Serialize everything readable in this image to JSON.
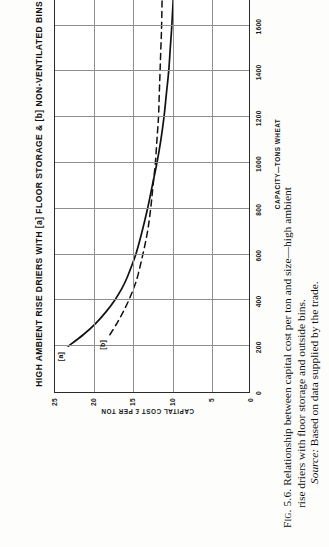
{
  "figure": {
    "chart_title": "HIGH AMBIENT RISE DRIERS WITH [a] FLOOR STORAGE & [b] NON-VENTILATED BINS OUTSIDE",
    "curve_label_a": "[a]",
    "curve_label_b": "[b]"
  },
  "caption": {
    "line1_label": "Fig. 5.6.",
    "line1_text": "Relationship between capital cost per ton and size—high ambient",
    "line2_text": "rise driers with floor storage and outside bins.",
    "line3_source_label": "Source:",
    "line3_text": "Based on data supplied by the trade."
  },
  "chart_data": {
    "type": "line",
    "title": "HIGH AMBIENT RISE DRIERS WITH [a] FLOOR STORAGE & [b] NON-VENTILATED BINS OUTSIDE",
    "xlabel": "CAPACITY—TONS WHEAT",
    "ylabel": "CAPITAL COST  £ PER TON",
    "xlim": [
      0,
      2000
    ],
    "ylim": [
      0,
      25
    ],
    "xticks": [
      0,
      200,
      400,
      600,
      800,
      1000,
      1200,
      1400,
      1600,
      1800,
      2000
    ],
    "xticklabels": [
      "0",
      "200",
      "400",
      "600",
      "800",
      "1000",
      "1200",
      "1400",
      "1600",
      "1800",
      "2000"
    ],
    "yticks": [
      0,
      5,
      10,
      15,
      20,
      25
    ],
    "yticklabels": [
      "0",
      "5",
      "10",
      "15",
      "20",
      "25"
    ],
    "grid": true,
    "grid_x_at": [
      200,
      400,
      600,
      800,
      1000,
      1200,
      1400,
      1600,
      1800
    ],
    "grid_y_at": [
      5,
      10,
      15,
      20
    ],
    "legend": "inline-labels",
    "series": [
      {
        "name": "[a] Floor storage",
        "style": "solid",
        "x": [
          200,
          250,
          300,
          350,
          400,
          450,
          500,
          600,
          700,
          800,
          900,
          1000,
          1100,
          1200,
          1300,
          1400,
          1500,
          1600,
          1800,
          2000
        ],
        "y": [
          23.3,
          21.4,
          19.8,
          18.5,
          17.4,
          16.5,
          15.8,
          14.7,
          13.9,
          13.2,
          12.6,
          12.0,
          11.5,
          11.1,
          10.8,
          10.5,
          10.3,
          10.1,
          9.8,
          9.6
        ]
      },
      {
        "name": "[b] Non-ventilated bins outside",
        "style": "dashed",
        "x": [
          250,
          300,
          350,
          400,
          450,
          500,
          600,
          700,
          800,
          900,
          1000,
          1100,
          1200,
          1300,
          1400,
          1500,
          1600,
          1800,
          2000
        ],
        "y": [
          18.0,
          17.1,
          16.3,
          15.6,
          15.0,
          14.5,
          13.8,
          13.2,
          12.8,
          12.5,
          12.2,
          12.0,
          11.8,
          11.7,
          11.6,
          11.5,
          11.4,
          11.3,
          11.2
        ]
      }
    ]
  }
}
